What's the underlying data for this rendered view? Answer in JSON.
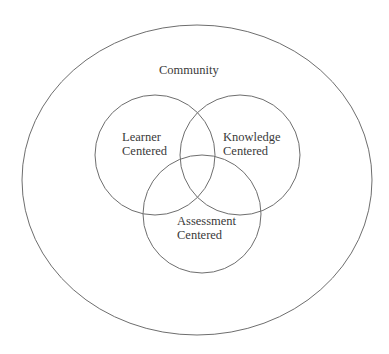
{
  "diagram": {
    "type": "nested-venn",
    "line_color": "#6e6e6e",
    "text_color": "#3a3a3a",
    "outer": {
      "label": "Community",
      "shape": "ellipse",
      "cx": 197,
      "cy": 180,
      "rx": 175,
      "ry": 155
    },
    "circles": [
      {
        "id": "learner",
        "label_line1": "Learner",
        "label_line2": "Centered",
        "cx": 155,
        "cy": 155,
        "r": 60
      },
      {
        "id": "knowledge",
        "label_line1": "Knowledge",
        "label_line2": "Centered",
        "cx": 240,
        "cy": 155,
        "r": 60
      },
      {
        "id": "assessment",
        "label_line1": "Assessment",
        "label_line2": "Centered",
        "cx": 202,
        "cy": 214,
        "r": 59
      }
    ]
  }
}
